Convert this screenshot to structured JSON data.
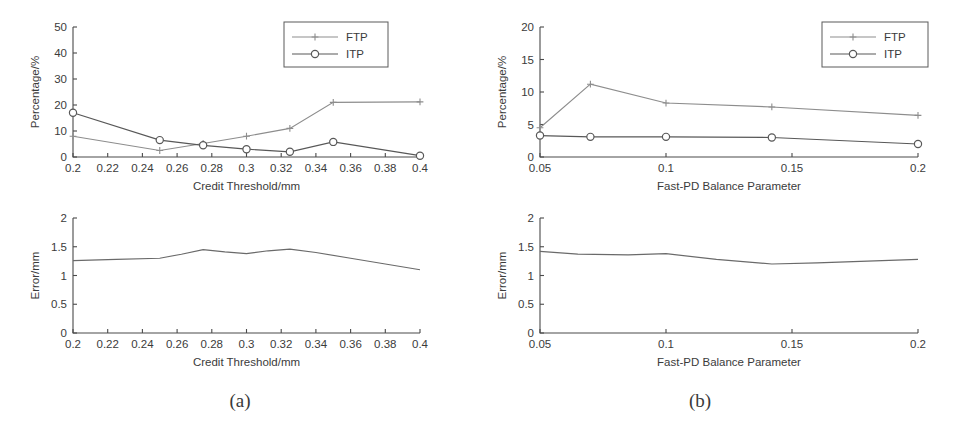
{
  "figure": {
    "background": "#ffffff",
    "ftp_color": "#8d8d8d",
    "itp_color": "#585858",
    "error_color": "#6a6a6a",
    "axis_color": "#4a4a4a"
  },
  "captions": {
    "a": "(a)",
    "b": "(b)"
  },
  "legend": {
    "ftp": "FTP",
    "itp": "ITP"
  },
  "chart_data": [
    {
      "id": "panel-a-top",
      "type": "line",
      "title": "",
      "xlabel": "Credit Threshold/mm",
      "ylabel": "Percentage/%",
      "xlim": [
        0.2,
        0.4
      ],
      "ylim": [
        0,
        50
      ],
      "xticks": [
        0.2,
        0.22,
        0.24,
        0.26,
        0.28,
        0.3,
        0.32,
        0.34,
        0.36,
        0.38,
        0.4
      ],
      "xticklabels": [
        "0.2",
        "0.22",
        "0.24",
        "0.26",
        "0.28",
        "0.3",
        "0.32",
        "0.34",
        "0.36",
        "0.38",
        "0.4"
      ],
      "yticks": [
        0,
        10,
        20,
        30,
        40,
        50
      ],
      "yticklabels": [
        "0",
        "10",
        "20",
        "30",
        "40",
        "50"
      ],
      "grid": false,
      "legend_position": "upper right",
      "x": [
        0.2,
        0.25,
        0.275,
        0.3,
        0.325,
        0.35,
        0.4
      ],
      "series": [
        {
          "name": "FTP",
          "marker": "plus",
          "color": "#8d8d8d",
          "values": [
            8.0,
            2.5,
            5.2,
            8.0,
            11.0,
            21.0,
            21.2
          ]
        },
        {
          "name": "ITP",
          "marker": "circle",
          "color": "#585858",
          "values": [
            17.0,
            6.5,
            4.5,
            3.0,
            2.0,
            5.8,
            0.5
          ]
        }
      ]
    },
    {
      "id": "panel-b-top",
      "type": "line",
      "title": "",
      "xlabel": "Fast-PD Balance Parameter",
      "ylabel": "Percentage/%",
      "xlim": [
        0.05,
        0.2
      ],
      "ylim": [
        0,
        20
      ],
      "xticks": [
        0.05,
        0.1,
        0.15,
        0.2
      ],
      "xticklabels": [
        "0.05",
        "0.1",
        "0.15",
        "0.2"
      ],
      "yticks": [
        0,
        5,
        10,
        15,
        20
      ],
      "yticklabels": [
        "0",
        "5",
        "10",
        "15",
        "20"
      ],
      "grid": false,
      "legend_position": "upper right",
      "x": [
        0.05,
        0.07,
        0.1,
        0.142,
        0.2
      ],
      "series": [
        {
          "name": "FTP",
          "marker": "plus",
          "color": "#8d8d8d",
          "values": [
            4.5,
            11.2,
            8.3,
            7.7,
            6.4
          ]
        },
        {
          "name": "ITP",
          "marker": "circle",
          "color": "#585858",
          "values": [
            3.3,
            3.1,
            3.1,
            3.0,
            2.0
          ]
        }
      ]
    },
    {
      "id": "panel-a-bottom",
      "type": "line",
      "title": "",
      "xlabel": "Credit Threshold/mm",
      "ylabel": "Error/mm",
      "xlim": [
        0.2,
        0.4
      ],
      "ylim": [
        0,
        2
      ],
      "xticks": [
        0.2,
        0.22,
        0.24,
        0.26,
        0.28,
        0.3,
        0.32,
        0.34,
        0.36,
        0.38,
        0.4
      ],
      "xticklabels": [
        "0.2",
        "0.22",
        "0.24",
        "0.26",
        "0.28",
        "0.3",
        "0.32",
        "0.34",
        "0.36",
        "0.38",
        "0.4"
      ],
      "yticks": [
        0,
        0.5,
        1,
        1.5,
        2
      ],
      "yticklabels": [
        "0",
        "0.5",
        "1",
        "1.5",
        "2"
      ],
      "grid": false,
      "legend_position": "none",
      "x": [
        0.2,
        0.225,
        0.25,
        0.2625,
        0.275,
        0.2875,
        0.3,
        0.3125,
        0.325,
        0.34,
        0.36,
        0.38,
        0.4
      ],
      "series": [
        {
          "name": "Error",
          "marker": "none",
          "color": "#6a6a6a",
          "values": [
            1.26,
            1.28,
            1.3,
            1.37,
            1.45,
            1.41,
            1.38,
            1.43,
            1.46,
            1.4,
            1.3,
            1.2,
            1.1
          ]
        }
      ]
    },
    {
      "id": "panel-b-bottom",
      "type": "line",
      "title": "",
      "xlabel": "Fast-PD Balance Parameter",
      "ylabel": "Error/mm",
      "xlim": [
        0.05,
        0.2
      ],
      "ylim": [
        0,
        2
      ],
      "xticks": [
        0.05,
        0.1,
        0.15,
        0.2
      ],
      "xticklabels": [
        "0.05",
        "0.1",
        "0.15",
        "0.2"
      ],
      "yticks": [
        0,
        0.5,
        1,
        1.5,
        2
      ],
      "yticklabels": [
        "0",
        "0.5",
        "1",
        "1.5",
        "2"
      ],
      "grid": false,
      "legend_position": "none",
      "x": [
        0.05,
        0.065,
        0.085,
        0.1,
        0.12,
        0.142,
        0.16,
        0.18,
        0.2
      ],
      "series": [
        {
          "name": "Error",
          "marker": "none",
          "color": "#6a6a6a",
          "values": [
            1.42,
            1.37,
            1.36,
            1.38,
            1.28,
            1.2,
            1.22,
            1.25,
            1.28
          ]
        }
      ]
    }
  ]
}
